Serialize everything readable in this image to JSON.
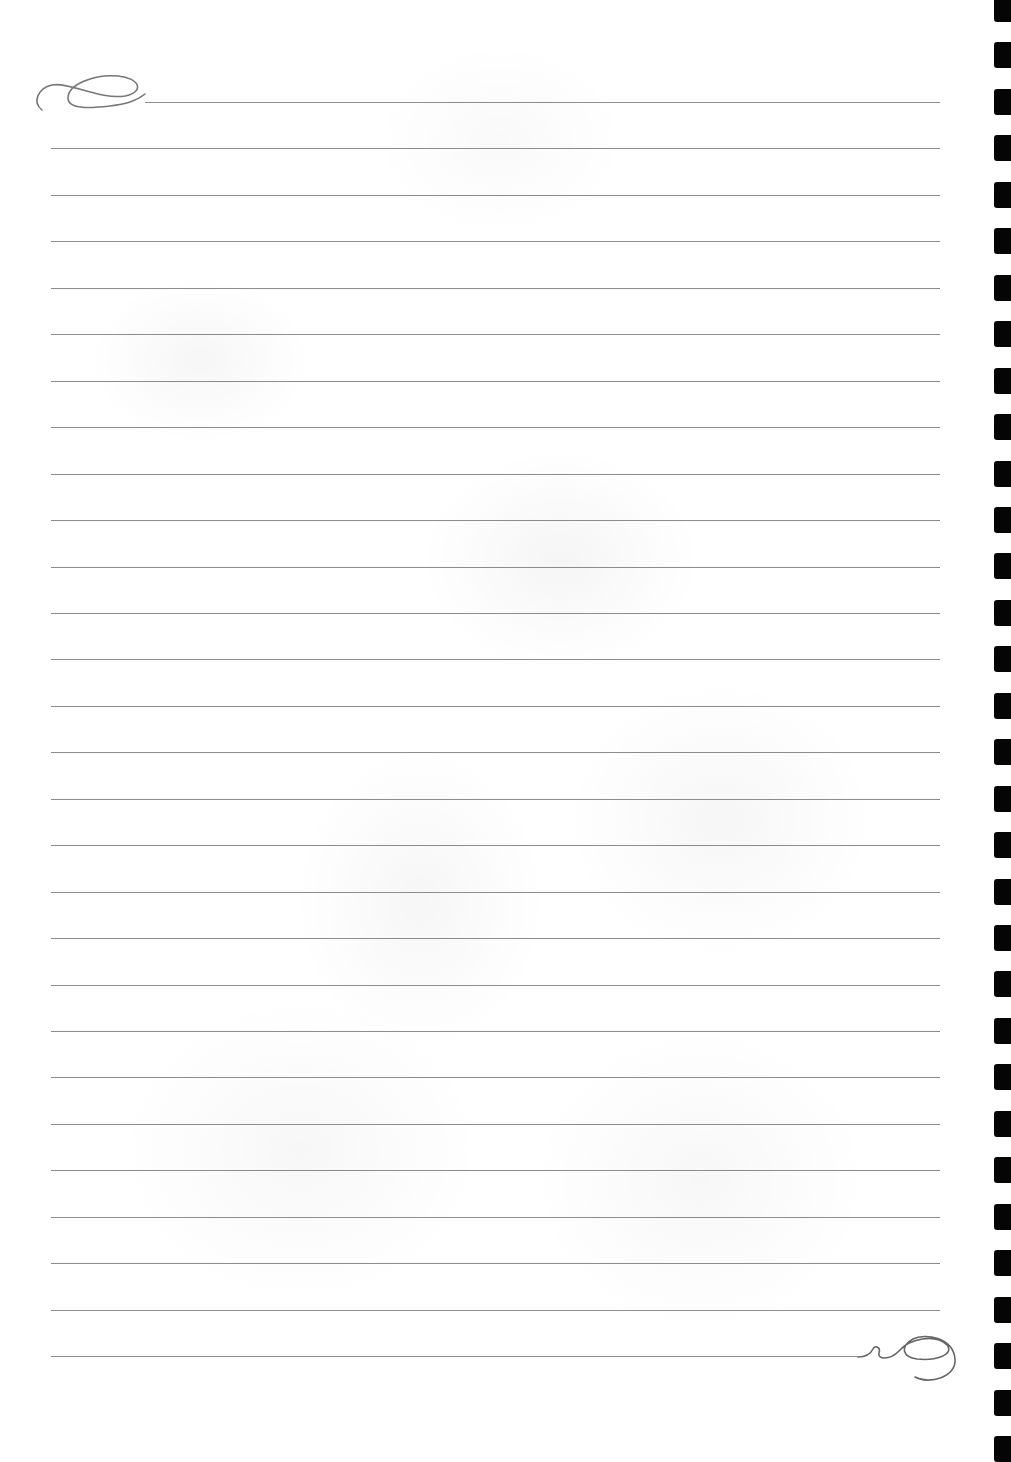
{
  "page": {
    "type": "lined-notebook-page",
    "background_color": "#ffffff",
    "rule_color": "#8c8c8c",
    "binder_color": "#050505"
  },
  "rules": {
    "count": 28,
    "first_y": 102,
    "spacing": 46.45,
    "left_x": 51,
    "right_x": 940,
    "first_line_left_x": 145,
    "last_line_right_x": 858
  },
  "binder_tabs": {
    "count": 32,
    "first_y": -4,
    "spacing": 46.45
  },
  "decorations": [
    {
      "name": "top-left-flourish"
    },
    {
      "name": "bottom-right-flourish"
    },
    {
      "name": "faded-floral-watermark"
    }
  ]
}
